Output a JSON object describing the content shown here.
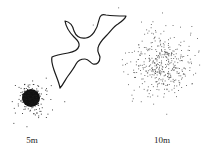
{
  "labels": {
    "near": "5m",
    "far": "10m"
  },
  "colors": {
    "ink": "#1a1a1a",
    "dots": "#555555"
  },
  "patterns": {
    "near": {
      "cx": 31,
      "cy": 98,
      "core_r": 9,
      "spread_r": 19,
      "count": 180
    },
    "far": {
      "cx": 162,
      "cy": 64,
      "core_r": 0,
      "spread_r": 36,
      "count": 420
    }
  }
}
